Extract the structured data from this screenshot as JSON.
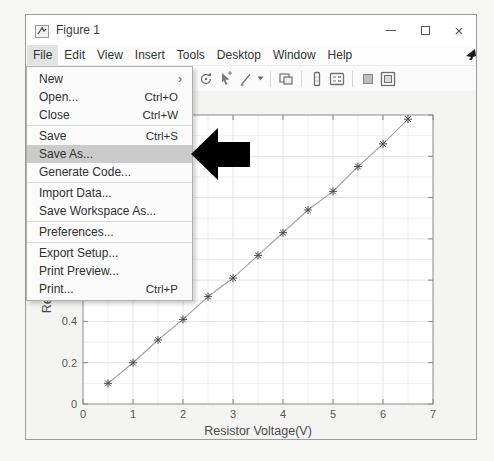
{
  "window": {
    "title": "Figure 1",
    "controls": [
      {
        "name": "minimize-button"
      },
      {
        "name": "maximize-button"
      },
      {
        "name": "close-button",
        "glyph": "×"
      }
    ]
  },
  "menubar": {
    "items": [
      {
        "label": "File",
        "open": true
      },
      {
        "label": "Edit"
      },
      {
        "label": "View"
      },
      {
        "label": "Insert"
      },
      {
        "label": "Tools"
      },
      {
        "label": "Desktop"
      },
      {
        "label": "Window"
      },
      {
        "label": "Help"
      }
    ]
  },
  "toolbar": {
    "icons": [
      {
        "name": "rotate-3d-icon"
      },
      {
        "name": "data-cursor-icon"
      },
      {
        "name": "brush-icon"
      },
      {
        "name": "brush-dropdown-caret"
      },
      {
        "name": "separator"
      },
      {
        "name": "link-plots-icon"
      },
      {
        "name": "separator"
      },
      {
        "name": "insert-colorbar-icon"
      },
      {
        "name": "insert-legend-icon"
      },
      {
        "name": "separator"
      },
      {
        "name": "hide-plot-tools-icon"
      },
      {
        "name": "dock-figure-icon"
      }
    ]
  },
  "file_menu": {
    "items": [
      {
        "label": "New",
        "submenu": true
      },
      {
        "label": "Open...",
        "shortcut": "Ctrl+O"
      },
      {
        "label": "Close",
        "shortcut": "Ctrl+W"
      },
      {
        "type": "separator"
      },
      {
        "label": "Save",
        "shortcut": "Ctrl+S"
      },
      {
        "label": "Save As...",
        "highlighted": true
      },
      {
        "label": "Generate Code..."
      },
      {
        "type": "separator"
      },
      {
        "label": "Import Data..."
      },
      {
        "label": "Save Workspace As..."
      },
      {
        "type": "separator"
      },
      {
        "label": "Preferences..."
      },
      {
        "type": "separator"
      },
      {
        "label": "Export Setup..."
      },
      {
        "label": "Print Preview..."
      },
      {
        "label": "Print...",
        "shortcut": "Ctrl+P"
      }
    ]
  },
  "annotation": {
    "type": "block-arrow-left",
    "color": "#000000",
    "points_to": "Save As..."
  },
  "chart_data": {
    "type": "line",
    "x": [
      0.5,
      1,
      1.5,
      2,
      2.5,
      3,
      3.5,
      4,
      4.5,
      5,
      5.5,
      6,
      6.5
    ],
    "y": [
      0.1,
      0.2,
      0.31,
      0.41,
      0.52,
      0.61,
      0.72,
      0.83,
      0.94,
      1.03,
      1.15,
      1.26,
      1.38
    ],
    "marker": "*",
    "title": "",
    "xlabel": "Resistor Voltage(V)",
    "ylabel": "Resistor Current(A)",
    "xlim": [
      0,
      7
    ],
    "ylim": [
      0,
      1.4
    ],
    "xticks": [
      0,
      1,
      2,
      3,
      4,
      5,
      6,
      7
    ],
    "yticks": [
      0,
      0.2,
      0.4,
      0.6,
      0.8,
      1,
      1.2,
      1.4
    ],
    "grid": true,
    "minor_grid": true,
    "legend": null,
    "line_color": "#a3a3a3",
    "marker_color": "#4d4d4d",
    "axis_color": "#8a8a8a",
    "tick_label_color": "#555555"
  },
  "colors": {
    "menu_highlight": "#cbcbcb",
    "annotation_arrow": "#000000",
    "figure_background": "#f4f4f3"
  }
}
